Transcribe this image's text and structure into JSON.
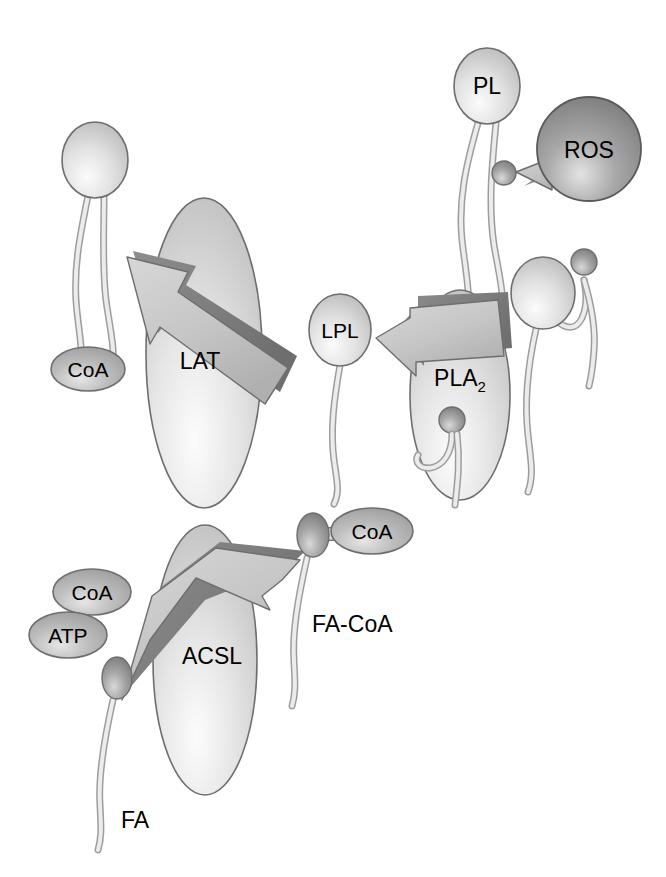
{
  "figure": {
    "background_color": "#ffffff",
    "width": 666,
    "height": 877
  },
  "palette": {
    "sphere_light": "#d8d8d8",
    "sphere_light_highlight": "#f2f2f2",
    "sphere_dark": "#8f8f8f",
    "sphere_dark_highlight": "#d5d5d5",
    "ellipse_enzyme": "#e2e2e2",
    "ellipse_enzyme_highlight": "#f6f6f6",
    "oval_substrate": "#b3b3b3",
    "oval_substrate_highlight": "#e0e0e0",
    "arrow_light": "#c9c9c9",
    "arrow_dark": "#808080",
    "tail_fill": "#e6e6e6",
    "outline": "#5a5a5a",
    "text_color": "#000000"
  },
  "enzymes": [
    {
      "id": "lat",
      "label": "LAT",
      "shape": "ellipse",
      "cx": 204,
      "cy": 353,
      "rx": 58,
      "ry": 155
    },
    {
      "id": "pla2",
      "label": "PLA",
      "subscript": "2",
      "shape": "ellipse",
      "cx": 460,
      "cy": 395,
      "rx": 50,
      "ry": 105
    },
    {
      "id": "acsl",
      "label": "ACSL",
      "shape": "ellipse",
      "cx": 205,
      "cy": 660,
      "rx": 52,
      "ry": 135
    }
  ],
  "molecules": [
    {
      "id": "pl",
      "label": "PL",
      "type": "phospholipid",
      "head_cx": 487,
      "head_cy": 86,
      "shade": "light"
    },
    {
      "id": "ros",
      "label": "ROS",
      "type": "sphere",
      "head_cx": 589,
      "head_cy": 149,
      "shade": "dark"
    },
    {
      "id": "lpl",
      "label": "LPL",
      "type": "lysophospholipid",
      "head_cx": 340,
      "head_cy": 330,
      "shade": "light"
    },
    {
      "id": "pl-right",
      "label": "",
      "type": "phospholipid",
      "head_cx": 543,
      "head_cy": 293,
      "shade": "light"
    },
    {
      "id": "pl-left",
      "label": "",
      "type": "phospholipid",
      "head_cx": 95,
      "head_cy": 160,
      "shade": "light"
    },
    {
      "id": "fa",
      "label": "FA",
      "type": "fatty-acid",
      "head_cx": 117,
      "head_cy": 678,
      "shade": "dark"
    },
    {
      "id": "fa-coa",
      "label": "FA-CoA",
      "type": "fatty-acyl-coa",
      "head_cx": 313,
      "head_cy": 535,
      "shade": "dark"
    }
  ],
  "substrate_ovals": [
    {
      "id": "coa-upper-left",
      "label": "CoA",
      "cx": 88,
      "cy": 369,
      "rx": 37,
      "ry": 22
    },
    {
      "id": "coa-lower-left",
      "label": "CoA",
      "cx": 92,
      "cy": 592,
      "rx": 39,
      "ry": 23
    },
    {
      "id": "atp-lower-left",
      "label": "ATP",
      "cx": 68,
      "cy": 635,
      "rx": 39,
      "ry": 23
    },
    {
      "id": "coa-fa-coa",
      "label": "CoA",
      "cx": 372,
      "cy": 531,
      "rx": 41,
      "ry": 23
    }
  ],
  "arrows": [
    {
      "id": "lat-arrow",
      "points_to": "upper-left",
      "label": ""
    },
    {
      "id": "ros-arrow",
      "points_to": "left",
      "label": ""
    },
    {
      "id": "pla2-arrow",
      "points_to": "left",
      "label": ""
    },
    {
      "id": "acsl-arrow",
      "points_to": "upper-right",
      "label": ""
    }
  ],
  "free_labels": [
    {
      "id": "fa-label",
      "text": "FA",
      "x": 121,
      "y": 828
    },
    {
      "id": "fa-coa-label",
      "text": "FA-CoA",
      "x": 312,
      "y": 632
    }
  ]
}
